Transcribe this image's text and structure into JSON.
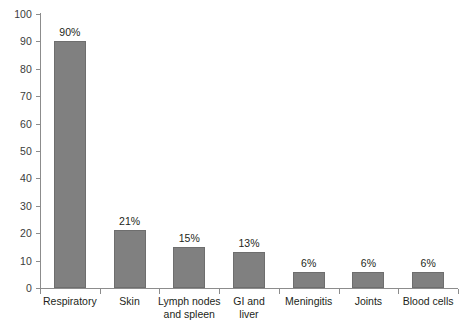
{
  "chart_data": {
    "type": "bar",
    "title": "",
    "subtitle": "",
    "xlabel": "",
    "ylabel": "",
    "ylim": [
      0,
      100
    ],
    "grid": false,
    "legend": null,
    "categories": [
      "Respiratory",
      "Skin",
      "Lymph nodes\nand spleen",
      "GI and\nliver",
      "Meningitis",
      "Joints",
      "Blood cells"
    ],
    "values": [
      90,
      21,
      15,
      13,
      6,
      6,
      6
    ],
    "data_labels": [
      "90%",
      "21%",
      "15%",
      "13%",
      "6%",
      "6%",
      "6%"
    ],
    "ytick_labels": [
      "100",
      "90",
      "80",
      "70",
      "60",
      "50",
      "40",
      "30",
      "20",
      "10",
      "0"
    ],
    "ytick_values": [
      100,
      90,
      80,
      70,
      60,
      50,
      40,
      30,
      20,
      10,
      0
    ],
    "colors": {
      "bar_fill": "#808080",
      "bar_border": "#6e6e6e",
      "axis": "#8c8c8c",
      "text": "#231f20",
      "tick_text": "#3b3b3b",
      "background": "#ffffff"
    }
  }
}
